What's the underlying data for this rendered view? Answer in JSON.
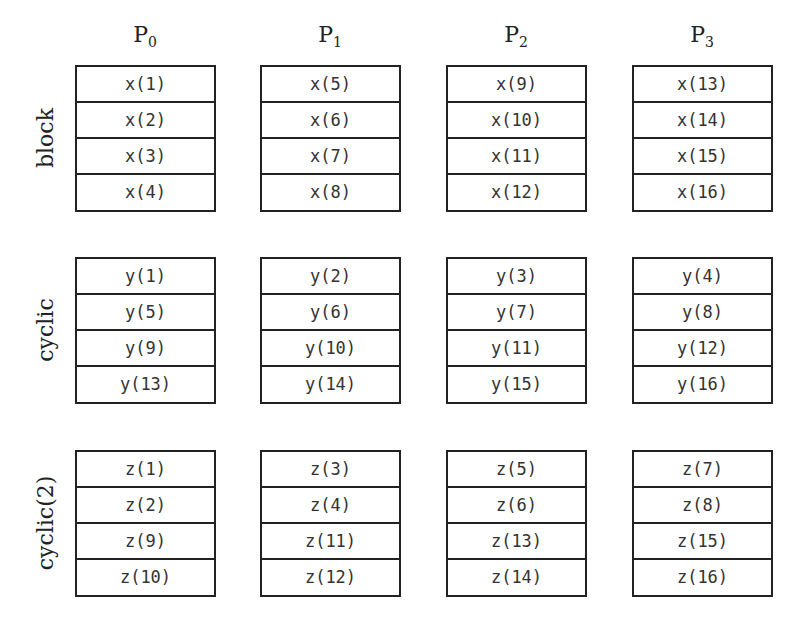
{
  "processors": [
    {
      "label": "P",
      "sub": "0"
    },
    {
      "label": "P",
      "sub": "1"
    },
    {
      "label": "P",
      "sub": "2"
    },
    {
      "label": "P",
      "sub": "3"
    }
  ],
  "distributions": [
    {
      "label": "block",
      "columns": [
        [
          "x(1)",
          "x(2)",
          "x(3)",
          "x(4)"
        ],
        [
          "x(5)",
          "x(6)",
          "x(7)",
          "x(8)"
        ],
        [
          "x(9)",
          "x(10)",
          "x(11)",
          "x(12)"
        ],
        [
          "x(13)",
          "x(14)",
          "x(15)",
          "x(16)"
        ]
      ]
    },
    {
      "label": "cyclic",
      "columns": [
        [
          "y(1)",
          "y(5)",
          "y(9)",
          "y(13)"
        ],
        [
          "y(2)",
          "y(6)",
          "y(10)",
          "y(14)"
        ],
        [
          "y(3)",
          "y(7)",
          "y(11)",
          "y(15)"
        ],
        [
          "y(4)",
          "y(8)",
          "y(12)",
          "y(16)"
        ]
      ]
    },
    {
      "label": "cyclic(2)",
      "columns": [
        [
          "z(1)",
          "z(2)",
          "z(9)",
          "z(10)"
        ],
        [
          "z(3)",
          "z(4)",
          "z(11)",
          "z(12)"
        ],
        [
          "z(5)",
          "z(6)",
          "z(13)",
          "z(14)"
        ],
        [
          "z(7)",
          "z(8)",
          "z(15)",
          "z(16)"
        ]
      ]
    }
  ]
}
